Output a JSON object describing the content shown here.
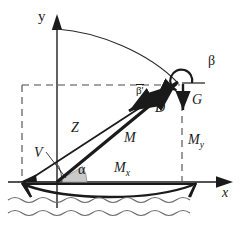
{
  "figure": {
    "background": "#ffffff",
    "stroke": "#1a1a1a",
    "fill_angle": "#c9c9c9",
    "width": 241,
    "height": 232
  },
  "axes": {
    "y_label": "y",
    "x_label": "x",
    "origin": {
      "x": 57,
      "y": 182
    },
    "y_top": {
      "x": 57,
      "y": 18
    },
    "x_right": {
      "x": 232,
      "y": 182
    }
  },
  "labels": {
    "alpha": "α",
    "beta": "β",
    "beta_prime": "β'",
    "Z": "Z",
    "M": "M",
    "D": "D",
    "G": "G",
    "V": "V",
    "M_x_base": "M",
    "M_x_sub": "x",
    "M_y_base": "M",
    "M_y_sub": "y"
  },
  "geometry": {
    "anchor_point": {
      "x": 22,
      "y": 182
    },
    "cable_top": {
      "x": 181,
      "y": 84
    },
    "dashed_rect": {
      "left": 22,
      "top": 85,
      "right": 182,
      "bottom": 182
    },
    "catenary_start": {
      "x": 57,
      "y": 29
    },
    "catenary_end": {
      "x": 178,
      "y": 84
    },
    "gravity_arrow": {
      "x": 183,
      "from_y": 86,
      "to_y": 118
    },
    "beta_arc_radius": 11
  },
  "elements": {
    "boat_deck_y": 183,
    "water_line_y": 200,
    "boat_left_x": 22,
    "boat_right_x": 196
  }
}
